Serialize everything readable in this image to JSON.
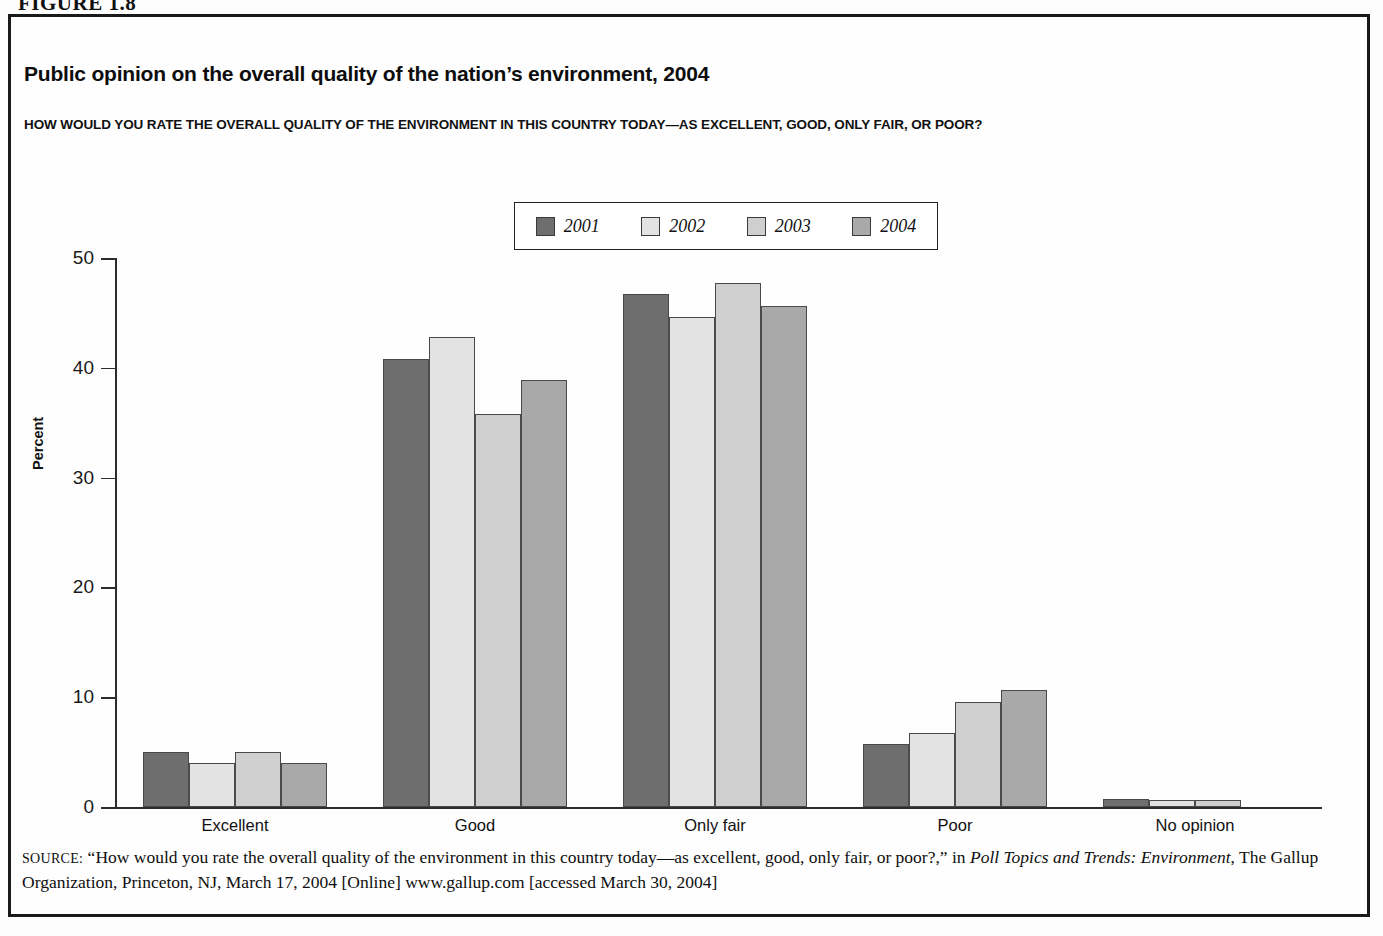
{
  "figure": {
    "caption": "FIGURE 1.8"
  },
  "title": "Public opinion on the overall quality of the nation’s environment, 2004",
  "subtitle": "HOW WOULD YOU RATE THE OVERALL QUALITY OF THE ENVIRONMENT IN THIS COUNTRY TODAY—AS EXCELLENT, GOOD, ONLY FAIR, OR POOR?",
  "source": {
    "label": "SOURCE:",
    "text_part1": " “How would you rate the overall quality of the environment in this country today—as excellent, good, only fair, or poor?,” in  ",
    "italic1": "Poll Topics and Trends: Environment",
    "text_part2": ", The Gallup Organization, Princeton, NJ, March 17, 2004 [Online] www.gallup.com [accessed March 30, 2004]"
  },
  "colors": {
    "series_2001": "#6e6e6e",
    "series_2002": "#e3e3e3",
    "series_2003": "#cfcfcf",
    "series_2004": "#a9a9a9",
    "axis": "#2c2c2c",
    "border": "#1a1a1a",
    "bar_outline": "#4a4a4a"
  },
  "chart_data": {
    "type": "bar",
    "title": "Public opinion on the overall quality of the nation’s environment, 2004",
    "subtitle": "HOW WOULD YOU RATE THE OVERALL QUALITY OF THE ENVIRONMENT IN THIS COUNTRY TODAY—AS EXCELLENT, GOOD, ONLY FAIR, OR POOR?",
    "xlabel": "",
    "ylabel": "Percent",
    "ylim": [
      0,
      50
    ],
    "yticks": [
      0,
      10,
      20,
      30,
      40,
      50
    ],
    "grid": false,
    "legend_position": "top-center",
    "categories": [
      "Excellent",
      "Good",
      "Only fair",
      "Poor",
      "No opinion"
    ],
    "series": [
      {
        "name": "2001",
        "color": "#6e6e6e",
        "values": [
          5.0,
          40.8,
          46.7,
          5.7,
          0.7
        ]
      },
      {
        "name": "2002",
        "color": "#e3e3e3",
        "values": [
          4.0,
          42.8,
          44.6,
          6.7,
          0.6
        ]
      },
      {
        "name": "2003",
        "color": "#cfcfcf",
        "values": [
          5.0,
          35.8,
          47.7,
          9.6,
          0.6
        ]
      },
      {
        "name": "2004",
        "color": "#a9a9a9",
        "values": [
          4.0,
          38.9,
          45.6,
          10.7,
          0.0
        ]
      }
    ]
  }
}
